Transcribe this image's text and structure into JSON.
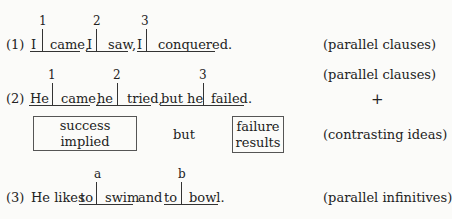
{
  "examples": [
    {
      "number": "(1)",
      "markers": [
        "1",
        "2",
        "3"
      ],
      "segments": [
        {
          "subject": "I",
          "predicate": "came,"
        },
        {
          "subject": "I",
          "predicate": "saw,"
        },
        {
          "subject": "I",
          "predicate": "conquered."
        }
      ],
      "label": "(parallel clauses)"
    },
    {
      "number": "(2)",
      "markers": [
        "1",
        "2",
        "3"
      ],
      "segments": [
        {
          "subject": "He",
          "predicate": "came,"
        },
        {
          "subject": "he",
          "predicate": "tried,"
        },
        {
          "subject": "but he",
          "predicate": "failed."
        }
      ],
      "label": "(parallel clauses)",
      "plus": "+",
      "contrast": {
        "left_box": "success implied",
        "connector": "but",
        "right_box_line1": "failure",
        "right_box_line2": "results",
        "label": "(contrasting ideas)"
      }
    },
    {
      "number": "(3)",
      "prefix": "He likes",
      "markers": [
        "a",
        "b"
      ],
      "segments": [
        {
          "subject": "to",
          "predicate": "swim"
        },
        {
          "subject": "to",
          "predicate": "bowl."
        }
      ],
      "connector": "and",
      "label": "(parallel infinitives)"
    }
  ]
}
